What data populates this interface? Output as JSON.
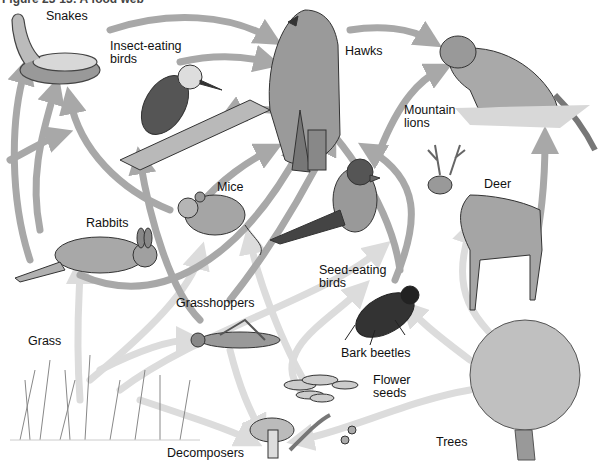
{
  "figure": {
    "caption": "Figure 23-13: A food web",
    "type": "food web illustration"
  },
  "organisms": [
    {
      "id": "snakes",
      "label": "Snakes",
      "x": 46,
      "y": 10
    },
    {
      "id": "insect-eating-birds",
      "label": "Insect-eating\nbirds",
      "x": 110,
      "y": 40
    },
    {
      "id": "hawks",
      "label": "Hawks",
      "x": 345,
      "y": 45
    },
    {
      "id": "mountain-lions",
      "label": "Mountain\nlions",
      "x": 404,
      "y": 104
    },
    {
      "id": "mice",
      "label": "Mice",
      "x": 217,
      "y": 181
    },
    {
      "id": "deer",
      "label": "Deer",
      "x": 484,
      "y": 178
    },
    {
      "id": "rabbits",
      "label": "Rabbits",
      "x": 86,
      "y": 217
    },
    {
      "id": "seed-eating-birds",
      "label": "Seed-eating\nbirds",
      "x": 319,
      "y": 264
    },
    {
      "id": "grasshoppers",
      "label": "Grasshoppers",
      "x": 176,
      "y": 297
    },
    {
      "id": "grass",
      "label": "Grass",
      "x": 28,
      "y": 335
    },
    {
      "id": "bark-beetles",
      "label": "Bark beetles",
      "x": 341,
      "y": 347
    },
    {
      "id": "flower-seeds",
      "label": "Flower\nseeds",
      "x": 373,
      "y": 374
    },
    {
      "id": "trees",
      "label": "Trees",
      "x": 436,
      "y": 436
    },
    {
      "id": "decomposers",
      "label": "Decomposers",
      "x": 167,
      "y": 447
    }
  ],
  "colors": {
    "arrow_dark": "#8c8c8c",
    "arrow_mid": "#a8a8a8",
    "arrow_light": "#dcdcdc",
    "ink": "#333333"
  }
}
